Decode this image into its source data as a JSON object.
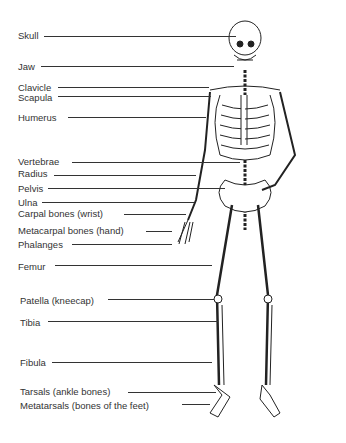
{
  "diagram": {
    "labels": [
      {
        "id": "skull",
        "text": "Skull",
        "x": 18,
        "y": 31,
        "lineFrom": 44,
        "lineTo": 236,
        "lineY": 36
      },
      {
        "id": "jaw",
        "text": "Jaw",
        "x": 18,
        "y": 62,
        "lineFrom": 41,
        "lineTo": 234,
        "lineY": 66
      },
      {
        "id": "clavicle",
        "text": "Clavicle",
        "x": 18,
        "y": 83,
        "lineFrom": 58,
        "lineTo": 209,
        "lineY": 87
      },
      {
        "id": "scapula",
        "text": "Scapula",
        "x": 18,
        "y": 93,
        "lineFrom": 58,
        "lineTo": 211,
        "lineY": 96
      },
      {
        "id": "humerus",
        "text": "Humerus",
        "x": 18,
        "y": 113,
        "lineFrom": 68,
        "lineTo": 206,
        "lineY": 117
      },
      {
        "id": "vertebrae",
        "text": "Vertebrae",
        "x": 18,
        "y": 157,
        "lineFrom": 72,
        "lineTo": 240,
        "lineY": 162
      },
      {
        "id": "radius",
        "text": "Radius",
        "x": 18,
        "y": 169,
        "lineFrom": 54,
        "lineTo": 196,
        "lineY": 175
      },
      {
        "id": "pelvis",
        "text": "Pelvis",
        "x": 18,
        "y": 184,
        "lineFrom": 48,
        "lineTo": 225,
        "lineY": 188
      },
      {
        "id": "ulna",
        "text": "Ulna",
        "x": 18,
        "y": 198,
        "lineFrom": 42,
        "lineTo": 194,
        "lineY": 202
      },
      {
        "id": "carpal",
        "text": "Carpal bones (wrist)",
        "x": 18,
        "y": 209,
        "lineFrom": 124,
        "lineTo": 186,
        "lineY": 214
      },
      {
        "id": "metacarpal",
        "text": "Metacarpal bones (hand)",
        "x": 18,
        "y": 226,
        "lineFrom": 146,
        "lineTo": 172,
        "lineY": 231
      },
      {
        "id": "phalanges",
        "text": "Phalanges",
        "x": 18,
        "y": 240,
        "lineFrom": 72,
        "lineTo": 172,
        "lineY": 244
      },
      {
        "id": "femur",
        "text": "Femur",
        "x": 18,
        "y": 262,
        "lineFrom": 55,
        "lineTo": 212,
        "lineY": 265
      },
      {
        "id": "patella",
        "text": "Patella (kneecap)",
        "x": 20,
        "y": 296,
        "lineFrom": 108,
        "lineTo": 214,
        "lineY": 299
      },
      {
        "id": "tibia",
        "text": "Tibia",
        "x": 20,
        "y": 318,
        "lineFrom": 48,
        "lineTo": 218,
        "lineY": 321
      },
      {
        "id": "fibula",
        "text": "Fibula",
        "x": 20,
        "y": 358,
        "lineFrom": 52,
        "lineTo": 212,
        "lineY": 362
      },
      {
        "id": "tarsals",
        "text": "Tarsals (ankle bones)",
        "x": 20,
        "y": 387,
        "lineFrom": 128,
        "lineTo": 216,
        "lineY": 392
      },
      {
        "id": "metatarsals",
        "text": "Metatarsals (bones of the feet)",
        "x": 20,
        "y": 401,
        "lineFrom": 182,
        "lineTo": 210,
        "lineY": 404
      }
    ]
  }
}
